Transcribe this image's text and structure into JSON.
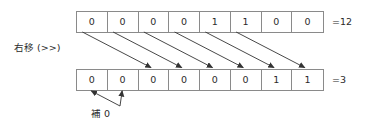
{
  "diagram": {
    "operation_label": "右移 (>>)",
    "fill_label": "補 0",
    "shift_amount": 2,
    "arrow_color": "#333333",
    "box_border_color": "#8a8a8a",
    "text_color": "#2b2b2b",
    "background_color": "#ffffff",
    "top_row": {
      "bits": [
        "0",
        "0",
        "0",
        "0",
        "1",
        "1",
        "0",
        "0"
      ],
      "value_label": "=12",
      "decimal_value": 12
    },
    "bottom_row": {
      "bits": [
        "0",
        "0",
        "0",
        "0",
        "0",
        "0",
        "1",
        "1"
      ],
      "value_label": "=3",
      "decimal_value": 3
    },
    "shift_arrows": [
      {
        "from_index": 0,
        "to_index": 2
      },
      {
        "from_index": 1,
        "to_index": 3
      },
      {
        "from_index": 2,
        "to_index": 4
      },
      {
        "from_index": 3,
        "to_index": 5
      },
      {
        "from_index": 4,
        "to_index": 6
      },
      {
        "from_index": 5,
        "to_index": 7
      }
    ],
    "fill_arrows": [
      {
        "to_index": 0
      },
      {
        "to_index": 1
      }
    ]
  }
}
